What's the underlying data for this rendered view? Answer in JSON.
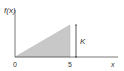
{
  "diagram": {
    "type": "probability-density-function",
    "ylabel": "f(x)",
    "xlabel": "x",
    "ticks": {
      "origin": "0",
      "end": "5"
    },
    "height_label": "K",
    "shape": "right triangle from (0,0) to (5,K)",
    "colors": {
      "axis": "#555555",
      "fill": "#c8c8c8",
      "text": "#333333"
    }
  }
}
